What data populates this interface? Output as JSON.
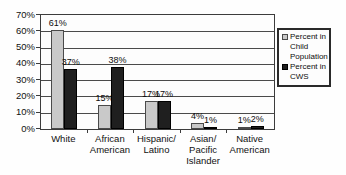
{
  "chart_data": {
    "type": "bar",
    "title": "",
    "xlabel": "",
    "ylabel": "",
    "categories": [
      {
        "name": "White",
        "lines": [
          "White"
        ]
      },
      {
        "name": "African American",
        "lines": [
          "African",
          "American"
        ]
      },
      {
        "name": "Hispanic/Latino",
        "lines": [
          "Hispanic/",
          "Latino"
        ]
      },
      {
        "name": "Asian/Pacific Islander",
        "lines": [
          "Asian/",
          "Pacific",
          "Islander"
        ]
      },
      {
        "name": "Native American",
        "lines": [
          "Native",
          "American"
        ]
      }
    ],
    "series": [
      {
        "name": "Percent in Child Population",
        "color": "#c9c9c9",
        "border": "#4a4a4a",
        "values": [
          61,
          15,
          17,
          4,
          1
        ]
      },
      {
        "name": "Percent in CWS",
        "color": "#1f1f1f",
        "border": "#000000",
        "values": [
          37,
          38,
          17,
          1,
          2
        ]
      }
    ],
    "data_labels": [
      [
        "61%",
        "37%"
      ],
      [
        "15%",
        "38%"
      ],
      [
        "17%",
        "17%"
      ],
      [
        "4%",
        "1%"
      ],
      [
        "1%",
        "2%"
      ]
    ],
    "ylim": [
      0,
      70
    ],
    "ytick_step": 10,
    "ytick_labels": [
      "0%",
      "10%",
      "20%",
      "30%",
      "40%",
      "50%",
      "60%",
      "70%"
    ],
    "grid": true,
    "legend_position": "right"
  }
}
